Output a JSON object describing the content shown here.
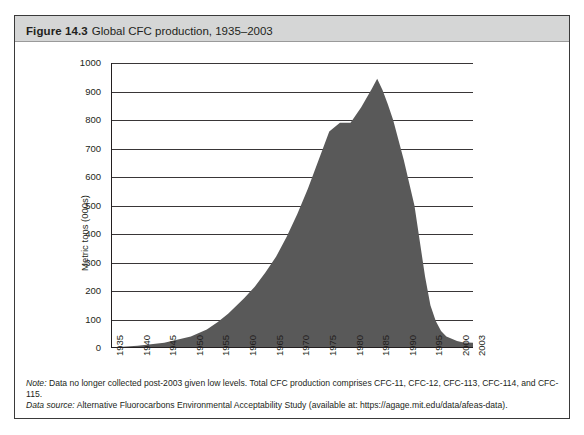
{
  "figure": {
    "number": "Figure 14.3",
    "title": "Global CFC production, 1935–2003"
  },
  "notes": {
    "note_label": "Note:",
    "note_text": "Data no longer collected post-2003 given low levels. Total CFC production comprises CFC-11, CFC-12, CFC-113, CFC-114, and CFC-115.",
    "source_label": "Data source:",
    "source_text": "Alternative Fluorocarbons Environmental Acceptability Study (available at: https://agage.mit.edu/data/afeas-data)."
  },
  "colors": {
    "area_fill": "#595959",
    "header_band": "#d5d6d6",
    "frame": "#3a3a3a",
    "gridline": "#231f20",
    "text": "#231f20"
  },
  "chart_data": {
    "type": "area",
    "title": "Global CFC production, 1935–2003",
    "xlabel": "",
    "ylabel": "Metric tons (000s)",
    "xlim": [
      1935,
      2003
    ],
    "ylim": [
      0,
      1000
    ],
    "grid": true,
    "legend": "none",
    "ytick_labels": [
      "0",
      "100",
      "200",
      "300",
      "400",
      "500",
      "600",
      "700",
      "800",
      "900",
      "1000"
    ],
    "ytick_values": [
      0,
      100,
      200,
      300,
      400,
      500,
      600,
      700,
      800,
      900,
      1000
    ],
    "xtick_labels": [
      "1935",
      "1940",
      "1945",
      "1950",
      "1955",
      "1960",
      "1965",
      "1970",
      "1975",
      "1980",
      "1985",
      "1990",
      "1995",
      "2000",
      "2003"
    ],
    "xtick_values": [
      1935,
      1940,
      1945,
      1950,
      1955,
      1960,
      1965,
      1970,
      1975,
      1980,
      1985,
      1990,
      1995,
      2000,
      2003
    ],
    "x": [
      1935,
      1940,
      1945,
      1950,
      1953,
      1955,
      1957,
      1960,
      1962,
      1964,
      1966,
      1968,
      1970,
      1972,
      1974,
      1976,
      1978,
      1980,
      1982,
      1984,
      1985,
      1986,
      1987,
      1988,
      1990,
      1992,
      1994,
      1995,
      1996,
      1997,
      1998,
      2000,
      2001,
      2003
    ],
    "values": [
      2,
      8,
      18,
      40,
      65,
      90,
      120,
      175,
      215,
      265,
      320,
      390,
      470,
      560,
      660,
      760,
      790,
      790,
      845,
      910,
      945,
      905,
      855,
      800,
      660,
      500,
      250,
      150,
      95,
      60,
      40,
      25,
      20,
      18
    ],
    "series": [
      {
        "name": "Global CFC production",
        "units": "thousand metric tons",
        "values": [
          2,
          8,
          18,
          40,
          65,
          90,
          120,
          175,
          215,
          265,
          320,
          390,
          470,
          560,
          660,
          760,
          790,
          790,
          845,
          910,
          945,
          905,
          855,
          800,
          660,
          500,
          250,
          150,
          95,
          60,
          40,
          25,
          20,
          18
        ]
      }
    ],
    "peak": {
      "year": 1985,
      "value": 945
    }
  }
}
